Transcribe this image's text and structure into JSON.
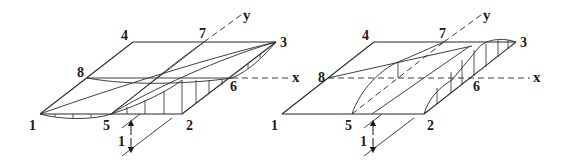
{
  "figure": {
    "panels": [
      {
        "id": "left",
        "axes": {
          "x": "x",
          "y": "y"
        },
        "node_labels": [
          "1",
          "2",
          "3",
          "4",
          "5",
          "6",
          "7",
          "8"
        ],
        "load_label": "1"
      },
      {
        "id": "right",
        "axes": {
          "x": "x",
          "y": "y"
        },
        "node_labels": [
          "1",
          "2",
          "3",
          "4",
          "5",
          "6",
          "7",
          "8"
        ],
        "load_label": "1"
      }
    ]
  },
  "labels": {
    "left": {
      "n1": "1",
      "n2": "2",
      "n3": "3",
      "n4": "4",
      "n5": "5",
      "n6": "6",
      "n7": "7",
      "n8": "8",
      "x": "x",
      "y": "y",
      "load": "1"
    },
    "right": {
      "n1": "1",
      "n2": "2",
      "n3": "3",
      "n4": "4",
      "n5": "5",
      "n6": "6",
      "n7": "7",
      "n8": "8",
      "x": "x",
      "y": "y",
      "load": "1"
    }
  }
}
